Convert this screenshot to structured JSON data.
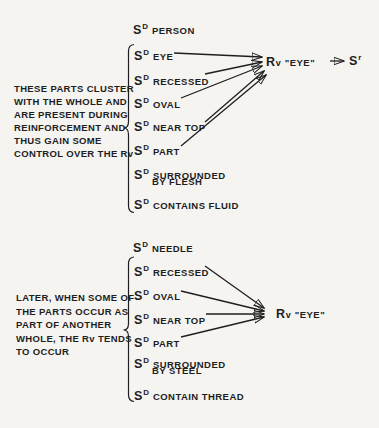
{
  "colors": {
    "ink": "#1e1e1e",
    "paper": "#f5f4f1"
  },
  "top": {
    "header": {
      "s": "S",
      "sup": "D",
      "label": "PERSON"
    },
    "note": {
      "lines": [
        "THESE PARTS CLUSTER",
        "WITH THE WHOLE AND",
        "ARE PRESENT DURING",
        "REINFORCEMENT AND",
        "THUS GAIN SOME",
        "CONTROL OVER THE Rv"
      ]
    },
    "items": [
      {
        "s": "S",
        "sup": "D",
        "label": "EYE"
      },
      {
        "s": "S",
        "sup": "D",
        "label": "RECESSED"
      },
      {
        "s": "S",
        "sup": "D",
        "label": "OVAL"
      },
      {
        "s": "S",
        "sup": "D",
        "label": "NEAR TOP"
      },
      {
        "s": "S",
        "sup": "D",
        "label": "PART"
      },
      {
        "s": "S",
        "sup": "D",
        "label": "SURROUNDED",
        "label2": "BY FLESH"
      },
      {
        "s": "S",
        "sup": "D",
        "label": "CONTAINS FLUID"
      }
    ],
    "response": {
      "r": "R",
      "sub": "v",
      "label": "\"EYE\""
    },
    "reinforcer": {
      "s": "S",
      "sup": "r"
    }
  },
  "bottom": {
    "header": {
      "s": "S",
      "sup": "D",
      "label": "NEEDLE"
    },
    "note": {
      "lines": [
        "LATER, WHEN SOME OF",
        "THE PARTS OCCUR AS",
        "PART OF ANOTHER",
        "WHOLE, THE Rv TENDS",
        "TO OCCUR"
      ]
    },
    "items": [
      {
        "s": "S",
        "sup": "D",
        "label": "RECESSED"
      },
      {
        "s": "S",
        "sup": "D",
        "label": "OVAL"
      },
      {
        "s": "S",
        "sup": "D",
        "label": "NEAR TOP"
      },
      {
        "s": "S",
        "sup": "D",
        "label": "PART"
      },
      {
        "s": "S",
        "sup": "D",
        "label": "SURROUNDED",
        "label2": "BY STEEL"
      },
      {
        "s": "S",
        "sup": "D",
        "label": "CONTAIN THREAD"
      }
    ],
    "response": {
      "r": "R",
      "sub": "v",
      "label": "\"EYE\""
    }
  }
}
